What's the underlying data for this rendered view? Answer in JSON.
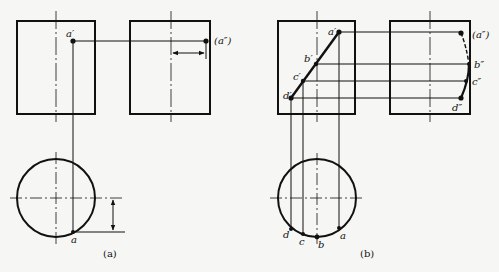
{
  "figure": {
    "subfigures": [
      {
        "id": "a",
        "caption": "(a)",
        "labels": {
          "front_point": "a′",
          "side_point": "(a″)",
          "top_point": "a"
        }
      },
      {
        "id": "b",
        "caption": "(b)",
        "labels": {
          "front_a": "a′",
          "front_b": "b′",
          "front_c": "c′",
          "front_d": "d′",
          "side_a": "(a″)",
          "side_b": "b″",
          "side_c": "c″",
          "side_d": "d″",
          "top_a": "a",
          "top_b": "b",
          "top_c": "c",
          "top_d": "d"
        }
      }
    ]
  },
  "colors": {
    "background": "#f6f6f4",
    "line": "#111111"
  }
}
